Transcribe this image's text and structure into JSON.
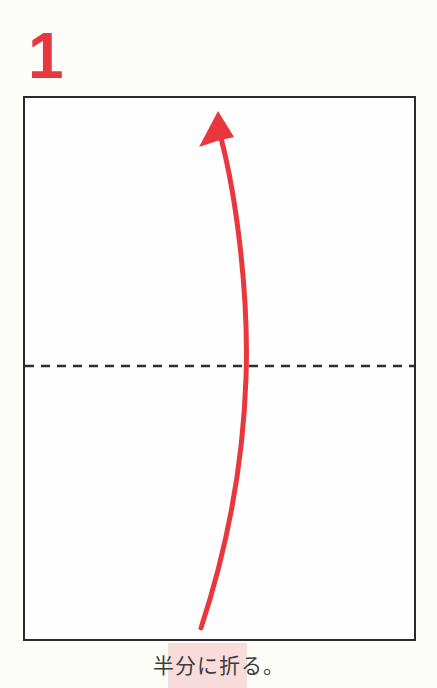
{
  "step": {
    "number": "1"
  },
  "caption": {
    "text": "半分に折る。"
  },
  "diagram": {
    "paper_shape": "rectangle",
    "fold_line_style": "dashed-horizontal-middle",
    "arrow_meaning": "fold-bottom-half-up"
  },
  "colors": {
    "accent_red": "#e8383d",
    "outline_dark": "#2b2b2b",
    "dash_dark": "#2e2e2e",
    "highlight_pink": "#f7dcdb",
    "caption_gray": "#3c3c3c",
    "page_background": "#fcfcf9",
    "paper_white": "#fefefe"
  }
}
